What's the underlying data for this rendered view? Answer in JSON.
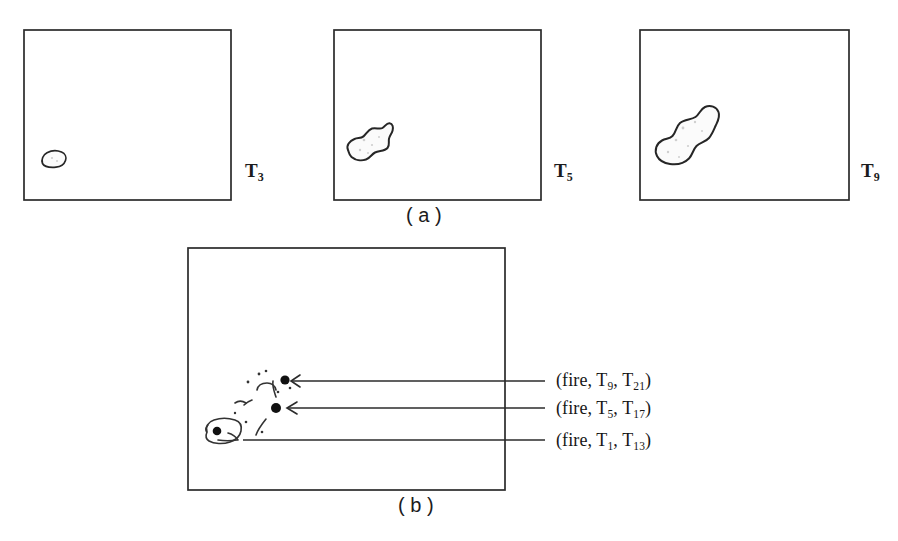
{
  "figure": {
    "background_color": "#ffffff",
    "ink_color": "#262626"
  },
  "panel_a": {
    "caption": "( a )",
    "frames": [
      {
        "id": "frame-t3",
        "time_label_base": "T",
        "time_label_sub": "3",
        "blob_size": "small",
        "blob_description": "small fire region near lower-left of frame"
      },
      {
        "id": "frame-t5",
        "time_label_base": "T",
        "time_label_sub": "5",
        "blob_size": "medium",
        "blob_description": "medium elongated fire region near lower-left of frame"
      },
      {
        "id": "frame-t9",
        "time_label_base": "T",
        "time_label_sub": "9",
        "blob_size": "large",
        "blob_description": "large elongated fire region near lower-left of frame"
      }
    ]
  },
  "panel_b": {
    "caption": "( b )",
    "annotations": [
      {
        "id": "annot-t9-t21",
        "text_prefix": "(fire, T",
        "sub1": "9",
        "text_middle": ", T",
        "sub2": "21",
        "text_suffix": ")",
        "full_text": "(fire, T9, T21)"
      },
      {
        "id": "annot-t5-t17",
        "text_prefix": "(fire, T",
        "sub1": "5",
        "text_middle": ", T",
        "sub2": "17",
        "text_suffix": ")",
        "full_text": "(fire, T5, T17)"
      },
      {
        "id": "annot-t1-t13",
        "text_prefix": "(fire, T",
        "sub1": "1",
        "text_middle": ", T",
        "sub2": "13",
        "text_suffix": ")",
        "full_text": "(fire, T1, T13)"
      }
    ],
    "node_count": 3,
    "graph_description": "three event nodes connected by hand-drawn links over a vehicle-shaped region"
  }
}
